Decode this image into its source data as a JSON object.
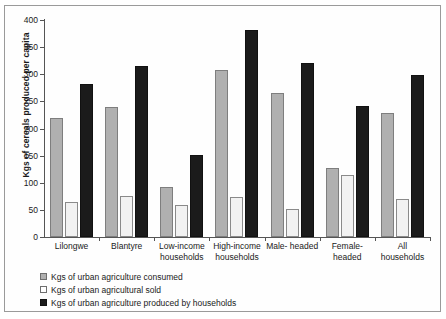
{
  "chart_data": {
    "type": "bar",
    "title": "",
    "xlabel": "",
    "ylabel": "Kgs of cereals produced per capita",
    "ylim": [
      0,
      400
    ],
    "ytick_step": 50,
    "yticks": [
      "400",
      "350",
      "300",
      "250",
      "200",
      "150",
      "100",
      "50",
      "0"
    ],
    "grid": false,
    "legend_position": "below-plot-left",
    "categories": [
      "Lilongwe",
      "Blantyre",
      "Low-income households",
      "High-income households",
      "Male- headed",
      "Female-headed",
      "All households"
    ],
    "category_lines": [
      [
        "Lilongwe"
      ],
      [
        "Blantyre"
      ],
      [
        "Low-income",
        "households"
      ],
      [
        "High-income",
        "households"
      ],
      [
        "Male- headed"
      ],
      [
        "Female-",
        "headed"
      ],
      [
        "All",
        "households"
      ]
    ],
    "series": [
      {
        "name": "Kgs of urban agriculture consumed",
        "key": "consumed",
        "color": "#b0b0b0",
        "values": [
          219,
          240,
          92,
          308,
          265,
          128,
          228
        ]
      },
      {
        "name": "Kgs of urban agricultural sold",
        "key": "sold",
        "color": "#f2f2f2",
        "values": [
          65,
          76,
          59,
          74,
          52,
          115,
          70
        ]
      },
      {
        "name": "Kgs of urban agriculture produced by households",
        "key": "produced",
        "color": "#1b1b1b",
        "values": [
          282,
          316,
          151,
          381,
          320,
          241,
          299
        ]
      }
    ]
  },
  "legend": {
    "items": [
      {
        "label": "Kgs of urban agriculture consumed",
        "swatch": "consumed"
      },
      {
        "label": "Kgs of urban agricultural sold",
        "swatch": "sold"
      },
      {
        "label": "Kgs of urban agriculture produced by households",
        "swatch": "produced"
      }
    ]
  }
}
